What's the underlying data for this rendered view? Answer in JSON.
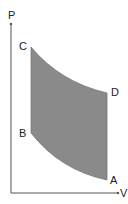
{
  "diagram": {
    "type": "pv-cycle",
    "axes": {
      "y_label": "P",
      "x_label": "V"
    },
    "points": [
      {
        "id": "A",
        "label": "A"
      },
      {
        "id": "B",
        "label": "B"
      },
      {
        "id": "C",
        "label": "C"
      },
      {
        "id": "D",
        "label": "D"
      }
    ],
    "colors": {
      "fill": "#8a8a8a",
      "axis": "#555555",
      "text": "#222222"
    }
  }
}
